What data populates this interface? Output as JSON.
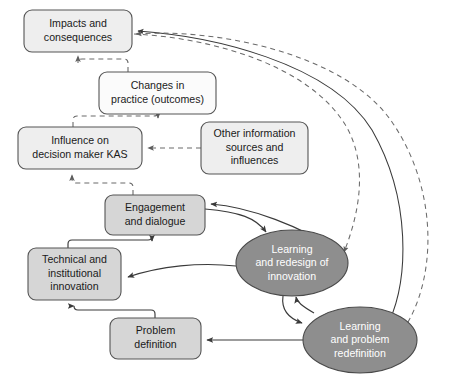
{
  "diagram": {
    "background_color": "#ffffff",
    "box_fill_dark": "#d6d6d6",
    "box_fill_light": "#eeeeee",
    "box_fill_white": "#fbfbfb",
    "ellipse_fill": "#8e8e8e",
    "line_color": "#3a3a3a",
    "dashed_line_color": "#6a6a6a",
    "nodes": [
      {
        "id": "impacts",
        "shape": "rounded-rect",
        "fill": "light",
        "x": 24,
        "y": 10,
        "w": 108,
        "h": 42,
        "lines": [
          "Impacts and",
          "consequences"
        ]
      },
      {
        "id": "changes",
        "shape": "rounded-rect",
        "fill": "white",
        "x": 99,
        "y": 72,
        "w": 117,
        "h": 42,
        "lines": [
          "Changes in",
          "practice (outcomes)"
        ]
      },
      {
        "id": "influence",
        "shape": "rounded-rect",
        "fill": "light",
        "x": 18,
        "y": 127,
        "w": 124,
        "h": 42,
        "lines": [
          "Influence on",
          "decision maker KAS"
        ]
      },
      {
        "id": "other-info",
        "shape": "rounded-rect",
        "fill": "light",
        "x": 201,
        "y": 122,
        "w": 107,
        "h": 52,
        "lines": [
          "Other information",
          "sources and",
          "influences"
        ]
      },
      {
        "id": "engagement",
        "shape": "rounded-rect",
        "fill": "dark",
        "x": 105,
        "y": 195,
        "w": 100,
        "h": 40,
        "lines": [
          "Engagement",
          "and dialogue"
        ]
      },
      {
        "id": "technical",
        "shape": "rounded-rect",
        "fill": "dark",
        "x": 28,
        "y": 248,
        "w": 93,
        "h": 52,
        "lines": [
          "Technical and",
          "institutional",
          "innovation"
        ]
      },
      {
        "id": "problem",
        "shape": "rounded-rect",
        "fill": "dark",
        "x": 110,
        "y": 318,
        "w": 91,
        "h": 41,
        "lines": [
          "Problem",
          "definition"
        ]
      },
      {
        "id": "learning-redesign",
        "shape": "ellipse",
        "fill": "ellipse",
        "cx": 292,
        "cy": 263,
        "rx": 56,
        "ry": 33,
        "lines": [
          "Learning",
          "and redesign of",
          "innovation"
        ]
      },
      {
        "id": "learning-problem",
        "shape": "ellipse",
        "fill": "ellipse",
        "cx": 360,
        "cy": 340,
        "rx": 57,
        "ry": 33,
        "lines": [
          "Learning",
          "and problem",
          "redefinition"
        ]
      }
    ],
    "edges": [
      {
        "id": "changes-to-impacts",
        "from": "changes",
        "to": "impacts",
        "style": "dashed",
        "kind": "orthogonal"
      },
      {
        "id": "influence-to-changes",
        "from": "influence",
        "to": "changes",
        "style": "dashed",
        "kind": "orthogonal"
      },
      {
        "id": "other-info-to-influence",
        "from": "other-info",
        "to": "influence",
        "style": "dashed",
        "kind": "straight"
      },
      {
        "id": "engagement-to-influence",
        "from": "engagement",
        "to": "influence",
        "style": "dashed",
        "kind": "orthogonal"
      },
      {
        "id": "technical-to-engagement",
        "from": "technical",
        "to": "engagement",
        "style": "solid",
        "kind": "orthogonal"
      },
      {
        "id": "problem-to-technical",
        "from": "problem",
        "to": "technical",
        "style": "solid",
        "kind": "orthogonal"
      },
      {
        "id": "engagement-to-learning-redesign",
        "from": "engagement",
        "to": "learning-redesign",
        "style": "solid",
        "kind": "curve"
      },
      {
        "id": "learning-redesign-to-engagement",
        "from": "learning-redesign",
        "to": "engagement",
        "style": "solid",
        "kind": "curve"
      },
      {
        "id": "learning-redesign-to-technical",
        "from": "learning-redesign",
        "to": "technical",
        "style": "solid",
        "kind": "curve"
      },
      {
        "id": "learning-redesign-to-learning-problem",
        "from": "learning-redesign",
        "to": "learning-problem",
        "style": "solid",
        "kind": "curve"
      },
      {
        "id": "learning-problem-to-learning-redesign",
        "from": "learning-problem",
        "to": "learning-redesign",
        "style": "solid",
        "kind": "curve"
      },
      {
        "id": "learning-problem-to-problem",
        "from": "learning-problem",
        "to": "problem",
        "style": "solid",
        "kind": "straight"
      },
      {
        "id": "learning-problem-to-impacts-solid",
        "from": "learning-problem",
        "to": "impacts",
        "style": "solid",
        "kind": "long-curve"
      },
      {
        "id": "learning-problem-to-impacts-dashed",
        "from": "learning-problem",
        "to": "impacts",
        "style": "dashed",
        "kind": "long-curve"
      },
      {
        "id": "impacts-to-learning-redesign-dashed",
        "from": "impacts",
        "to": "learning-redesign",
        "style": "dashed",
        "kind": "long-curve"
      }
    ]
  }
}
